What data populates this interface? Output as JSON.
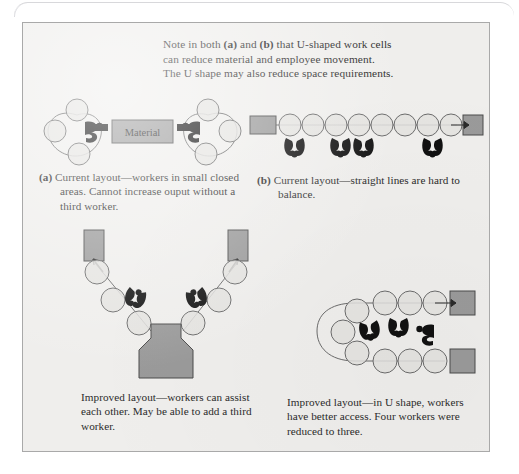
{
  "figure": {
    "note_line1_pre": "Note in both ",
    "note_a": "(a)",
    "note_line1_mid": " and ",
    "note_b": "(b)",
    "note_line1_post": " that U-shaped work cells",
    "note_line2": "can reduce material and employee movement.",
    "note_line3": "The U shape may also reduce space requirements.",
    "note_full": "Note in both (a) and (b) that U-shaped work cells can reduce material and employee movement. The U shape may also reduce space requirements."
  },
  "panels": {
    "a": {
      "label": "(a)",
      "caption": "Current layout—workers in small closed areas. Cannot increase ouput without a third worker.",
      "material_box_label": "Material",
      "workstations": 6,
      "workers": 2
    },
    "b": {
      "label": "(b)",
      "caption": "Current layout—straight lines are hard to balance.",
      "workstations": 8,
      "workers": 4
    },
    "c": {
      "label": "",
      "caption": "Improved layout—workers can assist each other. May be able to add a third worker.",
      "workstations": 6,
      "workers": 2
    },
    "d": {
      "label": "",
      "caption": "Improved layout—in U shape, workers have better access. Four workers were reduced to three.",
      "workstations": 10,
      "workers": 3
    }
  },
  "colors": {
    "panel_background": "#efeeec",
    "panel_border": "#a9a9a9",
    "box_fill": "#9a9a9a",
    "box_stroke": "#4a4a4a",
    "circle_fill": "#e3e2df",
    "circle_stroke": "#6b6b6b",
    "worker_fill": "#1a1a1a",
    "text": "#2b2b2b"
  }
}
